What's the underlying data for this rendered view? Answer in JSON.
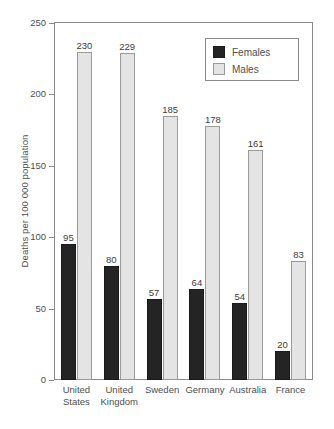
{
  "chart_data": {
    "type": "bar",
    "title": "",
    "subtitle": "",
    "xlabel": "",
    "ylabel": "Deaths per 100 000 population",
    "ylim": [
      0,
      250
    ],
    "yticks": [
      0,
      50,
      100,
      150,
      200,
      250
    ],
    "ytick_labels": [
      "0",
      "50",
      "100",
      "150",
      "200",
      "250"
    ],
    "grid": false,
    "legend_position": "top-right",
    "categories": [
      "United States",
      "United Kingdom",
      "Sweden",
      "Germany",
      "Australia",
      "France"
    ],
    "category_lines": [
      [
        "United",
        "States"
      ],
      [
        "United",
        "Kingdom"
      ],
      [
        "Sweden"
      ],
      [
        "Germany"
      ],
      [
        "Australia"
      ],
      [
        "France"
      ]
    ],
    "series": [
      {
        "name": "Females",
        "color": "#242424",
        "values": [
          95,
          80,
          57,
          64,
          54,
          20
        ],
        "labels": [
          "95",
          "80",
          "57",
          "64",
          "54",
          "20"
        ]
      },
      {
        "name": "Males",
        "color": "#e4e4e4",
        "values": [
          230,
          229,
          185,
          178,
          161,
          83
        ],
        "labels": [
          "230",
          "229",
          "185",
          "178",
          "161",
          "83"
        ]
      }
    ]
  },
  "legend": {
    "items": [
      {
        "label": "Females",
        "swatch": "females"
      },
      {
        "label": "Males",
        "swatch": "males"
      }
    ]
  },
  "colors": {
    "females": "#242424",
    "males": "#e4e4e4",
    "axis": "#8b8b8b",
    "text": "#4f4f4f",
    "background": "#ffffff"
  }
}
